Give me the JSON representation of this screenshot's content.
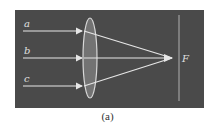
{
  "figure": {
    "caption": "(a)",
    "panel": {
      "x": 15,
      "y": 10,
      "width": 189,
      "height": 98,
      "color": "#4a4a4a"
    },
    "colors": {
      "ray": "#e6e6e6",
      "lens_fill": "#7a7a7a",
      "lens_stroke": "#d8d8d8",
      "focal_line": "#b0b0b0",
      "label": "#e0e0e0"
    },
    "lens": {
      "cx": 90,
      "cy": 58,
      "rx": 7,
      "ry": 40,
      "type": "converging"
    },
    "focal_point": {
      "label": "F",
      "x": 172,
      "y": 58
    },
    "focal_plane_line": {
      "x": 179,
      "y1": 15,
      "y2": 101
    },
    "rays": [
      {
        "label": "a",
        "y": 31
      },
      {
        "label": "b",
        "y": 58
      },
      {
        "label": "c",
        "y": 86
      }
    ]
  }
}
